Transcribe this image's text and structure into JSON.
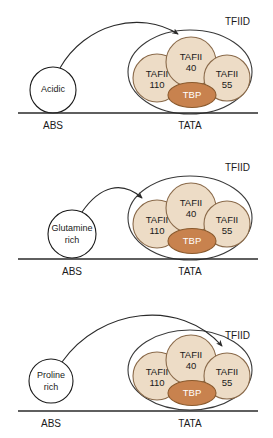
{
  "figure": {
    "name": "tfiid-activator-interaction-diagram",
    "panel_count": 3
  },
  "labels": {
    "complex": "TFIID",
    "tbp": "TBP",
    "activator_binding_site": "ABS",
    "tata_box": "TATA",
    "taf110_line1": "TAFII",
    "taf110_line2": "110",
    "taf40_line1": "TAFII",
    "taf40_line2": "40",
    "taf55_line1": "TAFII",
    "taf55_line2": "55"
  },
  "panels": [
    {
      "id": "panel-acidic",
      "activator_line1": "Acidic",
      "activator_line2": "",
      "target_subunit": "TAFII 40"
    },
    {
      "id": "panel-glutamine-rich",
      "activator_line1": "Glutamine",
      "activator_line2": "rich",
      "target_subunit": "TAFII 110"
    },
    {
      "id": "panel-proline-rich",
      "activator_line1": "Proline",
      "activator_line2": "rich",
      "target_subunit": "TAFII 55"
    }
  ],
  "colors": {
    "taf_fill": "#EDDCC6",
    "taf_stroke": "#8A6A4A",
    "tbp_fill": "#C8824E",
    "tbp_stroke": "#8A5A2E",
    "envelope_stroke": "#3a3a3a",
    "activator_fill": "#ffffff",
    "activator_stroke": "#1a1a1a",
    "baseline": "#2a2a2a",
    "text": "#1a1a1a"
  }
}
